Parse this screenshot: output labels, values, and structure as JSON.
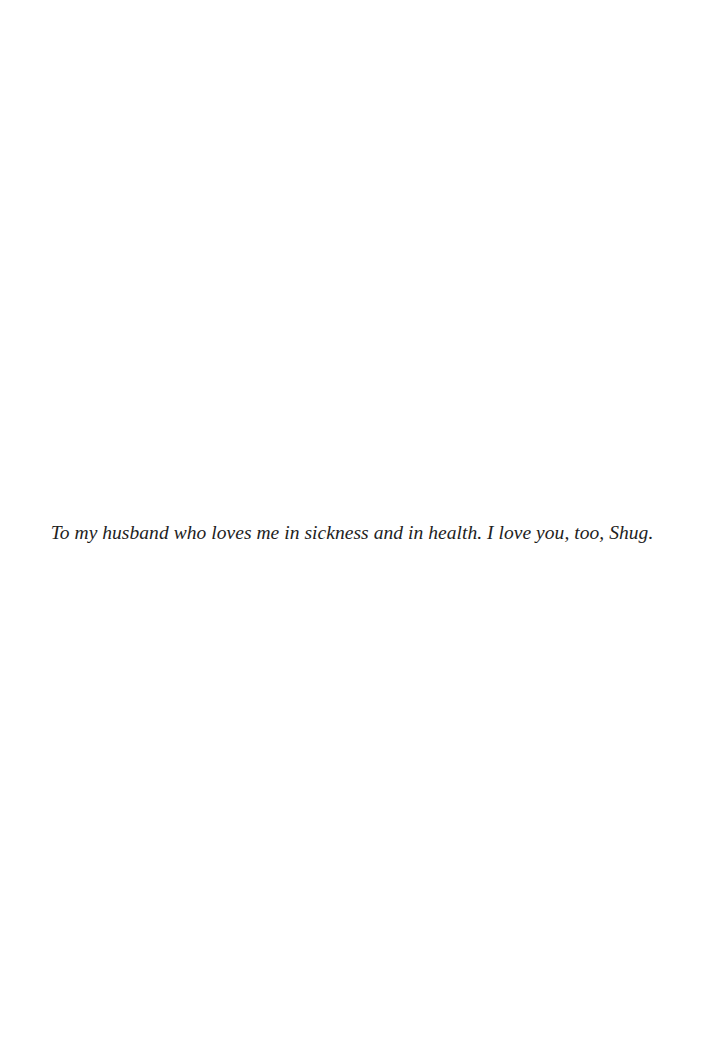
{
  "page": {
    "background_color": "#ffffff",
    "text_color": "#1e1e1e"
  },
  "dedication": {
    "text": "To my husband who loves me in sickness and in health. I love you, too, Shug."
  }
}
